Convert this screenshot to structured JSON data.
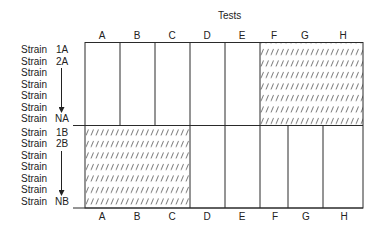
{
  "title": "Tests",
  "columns": [
    "A",
    "B",
    "C",
    "D",
    "E",
    "F",
    "G",
    "H"
  ],
  "group_a": {
    "rows": [
      {
        "label": "Strain",
        "id": "1A"
      },
      {
        "label": "Strain",
        "id": "2A"
      },
      {
        "label": "Strain",
        "id": ""
      },
      {
        "label": "Strain",
        "id": ""
      },
      {
        "label": "Strain",
        "id": ""
      },
      {
        "label": "Strain",
        "id": ""
      },
      {
        "label": "Strain",
        "id": "NA"
      }
    ],
    "hatched_columns": [
      "F",
      "G",
      "H"
    ]
  },
  "group_b": {
    "rows": [
      {
        "label": "Strain",
        "id": "1B"
      },
      {
        "label": "Strain",
        "id": "2B"
      },
      {
        "label": "Strain",
        "id": ""
      },
      {
        "label": "Strain",
        "id": ""
      },
      {
        "label": "Strain",
        "id": ""
      },
      {
        "label": "Strain",
        "id": ""
      },
      {
        "label": "Strain",
        "id": "NB"
      }
    ],
    "hatched_columns": [
      "A",
      "B",
      "C"
    ]
  },
  "colors": {
    "line": "#2a2a2a",
    "hatch": "#555555",
    "text": "#222222"
  }
}
